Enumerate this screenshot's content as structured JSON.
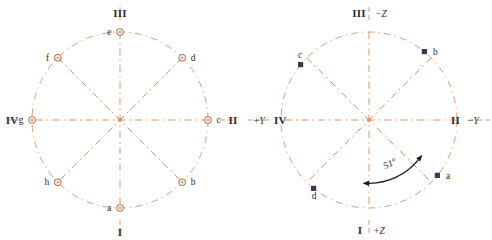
{
  "figure": {
    "type": "diagram",
    "colors": {
      "line": "#e0935f",
      "line_light": "#eaa97c",
      "marker_open_ring": "#c2724a",
      "marker_fill_dark": "#3a3a4a",
      "text": "#2b2b2b",
      "arc_arrow": "#1a1a1a",
      "background": "#ffffff"
    },
    "geometry": {
      "radius": 88,
      "center_left": [
        120,
        120
      ],
      "center_right": [
        123,
        120
      ],
      "spoke_count": 8,
      "spoke_step_deg": 45
    }
  },
  "left_diagram": {
    "name": "left-circle-diagram",
    "marker_style": "open-circle",
    "quadrant_labels": [
      {
        "id": "I",
        "text": "I",
        "position": "bottom"
      },
      {
        "id": "II",
        "text": "II",
        "position": "right"
      },
      {
        "id": "III",
        "text": "III",
        "position": "top"
      },
      {
        "id": "IV",
        "text": "IV",
        "position": "left"
      }
    ],
    "points": [
      {
        "id": "a",
        "label": "a",
        "angle_deg": 270,
        "label_side": "left"
      },
      {
        "id": "b",
        "label": "b",
        "angle_deg": 315,
        "label_side": "right"
      },
      {
        "id": "c",
        "label": "c",
        "angle_deg": 0,
        "label_side": "right"
      },
      {
        "id": "d",
        "label": "d",
        "angle_deg": 45,
        "label_side": "right"
      },
      {
        "id": "e",
        "label": "e",
        "angle_deg": 90,
        "label_side": "left"
      },
      {
        "id": "f",
        "label": "f",
        "angle_deg": 135,
        "label_side": "left"
      },
      {
        "id": "g",
        "label": "g",
        "angle_deg": 180,
        "label_side": "left"
      },
      {
        "id": "h",
        "label": "h",
        "angle_deg": 225,
        "label_side": "left"
      }
    ]
  },
  "right_diagram": {
    "name": "right-circle-diagram",
    "marker_style": "filled-square",
    "axis_labels": [
      {
        "id": "top",
        "roman": "III",
        "axis": "−Z",
        "position": "top"
      },
      {
        "id": "right",
        "roman": "II",
        "axis": "−Y",
        "position": "right"
      },
      {
        "id": "bottom",
        "roman": "I",
        "axis": "+Z",
        "position": "bottom"
      },
      {
        "id": "left",
        "roman": "IV",
        "axis": "+Y",
        "position": "left"
      }
    ],
    "points": [
      {
        "id": "a",
        "label": "a",
        "angle_deg": -39,
        "label_side": "right"
      },
      {
        "id": "b",
        "label": "b",
        "angle_deg": 51,
        "label_side": "right"
      },
      {
        "id": "c",
        "label": "c",
        "angle_deg": 141,
        "label_side": "above"
      },
      {
        "id": "d",
        "label": "d",
        "angle_deg": 231,
        "label_side": "below"
      }
    ],
    "annotation": {
      "id": "angle-arc",
      "text": "51°",
      "value": 51,
      "unit": "degrees",
      "from_angle_deg": 270,
      "to_angle_deg": -39,
      "arrow": "double-headed"
    }
  }
}
